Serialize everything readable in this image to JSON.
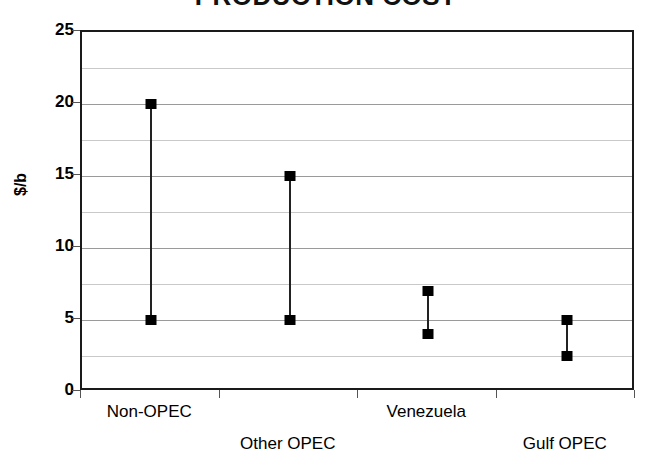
{
  "chart_data": {
    "type": "line",
    "title": "PRODUCTION COST",
    "xlabel": "",
    "ylabel": "$/b",
    "ylim": [
      0,
      25
    ],
    "ytick_labels": [
      "0",
      "5",
      "10",
      "15",
      "20",
      "25"
    ],
    "yticks": [
      0,
      5,
      10,
      15,
      20,
      25
    ],
    "gridlines": [
      2.5,
      5,
      7.5,
      10,
      12.5,
      15,
      17.5,
      20,
      22.5
    ],
    "grid": true,
    "legend": "none",
    "categories": [
      "Non-OPEC",
      "Other OPEC",
      "Venezuela",
      "Gulf OPEC"
    ],
    "series": [
      {
        "name": "High",
        "values": [
          20,
          15,
          7,
          5
        ]
      },
      {
        "name": "Low",
        "values": [
          5,
          5,
          4,
          2.5
        ]
      }
    ],
    "points": [
      {
        "category": "Non-OPEC",
        "low": 5,
        "high": 20
      },
      {
        "category": "Other OPEC",
        "low": 5,
        "high": 15
      },
      {
        "category": "Venezuela",
        "low": 4,
        "high": 7
      },
      {
        "category": "Gulf OPEC",
        "low": 2.5,
        "high": 5
      }
    ]
  },
  "axis": {
    "y_title": "$/b",
    "y_labels": [
      "25",
      "20",
      "15",
      "10",
      "5",
      "0"
    ]
  },
  "x_labels": [
    {
      "text": "Non-OPEC",
      "row": 0
    },
    {
      "text": "Other OPEC",
      "row": 1
    },
    {
      "text": "Venezuela",
      "row": 0
    },
    {
      "text": "Gulf OPEC",
      "row": 1
    }
  ]
}
